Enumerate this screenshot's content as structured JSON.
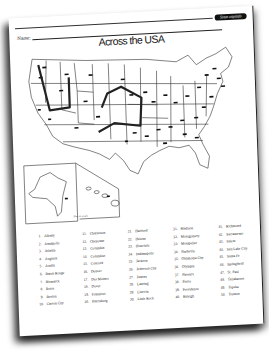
{
  "header": {
    "badge_label": "State capitals",
    "name_label": "Name"
  },
  "title": "Across the USA",
  "map": {
    "scale_note": "Not to scale",
    "route_color": "#222222",
    "insets": [
      "Alaska",
      "Hawaii"
    ]
  },
  "capitals": {
    "columns": [
      [
        {
          "num": "1.",
          "name": "Albany"
        },
        {
          "num": "2.",
          "name": "Annapolis"
        },
        {
          "num": "3.",
          "name": "Atlanta"
        },
        {
          "num": "4.",
          "name": "Augusta"
        },
        {
          "num": "5.",
          "name": "Austin"
        },
        {
          "num": "6.",
          "name": "Baton Rouge"
        },
        {
          "num": "7.",
          "name": "Bismarck"
        },
        {
          "num": "8.",
          "name": "Boise"
        },
        {
          "num": "9.",
          "name": "Boston"
        },
        {
          "num": "10.",
          "name": "Carson City"
        }
      ],
      [
        {
          "num": "11.",
          "name": "Charleston"
        },
        {
          "num": "12.",
          "name": "Cheyenne"
        },
        {
          "num": "13.",
          "name": "Columbia"
        },
        {
          "num": "14.",
          "name": "Columbus"
        },
        {
          "num": "15.",
          "name": "Concord"
        },
        {
          "num": "16.",
          "name": "Denver"
        },
        {
          "num": "17.",
          "name": "Des Moines"
        },
        {
          "num": "18.",
          "name": "Dover"
        },
        {
          "num": "19.",
          "name": "Frankfort"
        },
        {
          "num": "20.",
          "name": "Harrisburg"
        }
      ],
      [
        {
          "num": "21.",
          "name": "Hartford"
        },
        {
          "num": "22.",
          "name": "Helena"
        },
        {
          "num": "23.",
          "name": "Honolulu"
        },
        {
          "num": "24.",
          "name": "Indianapolis"
        },
        {
          "num": "25.",
          "name": "Jackson"
        },
        {
          "num": "26.",
          "name": "Jefferson City"
        },
        {
          "num": "27.",
          "name": "Juneau"
        },
        {
          "num": "28.",
          "name": "Lansing"
        },
        {
          "num": "29.",
          "name": "Lincoln"
        },
        {
          "num": "30.",
          "name": "Little Rock"
        }
      ],
      [
        {
          "num": "31.",
          "name": "Madison"
        },
        {
          "num": "32.",
          "name": "Montgomery"
        },
        {
          "num": "33.",
          "name": "Montpelier"
        },
        {
          "num": "34.",
          "name": "Nashville"
        },
        {
          "num": "35.",
          "name": "Oklahoma City"
        },
        {
          "num": "36.",
          "name": "Olympia"
        },
        {
          "num": "37.",
          "name": "Phoenix"
        },
        {
          "num": "38.",
          "name": "Pierre"
        },
        {
          "num": "39.",
          "name": "Providence"
        },
        {
          "num": "40.",
          "name": "Raleigh"
        }
      ],
      [
        {
          "num": "41.",
          "name": "Richmond"
        },
        {
          "num": "42.",
          "name": "Sacramento"
        },
        {
          "num": "43.",
          "name": "Salem"
        },
        {
          "num": "44.",
          "name": "Salt Lake City"
        },
        {
          "num": "45.",
          "name": "Santa Fe"
        },
        {
          "num": "46.",
          "name": "Springfield"
        },
        {
          "num": "47.",
          "name": "St. Paul"
        },
        {
          "num": "48.",
          "name": "Tallahassee"
        },
        {
          "num": "49.",
          "name": "Topeka"
        },
        {
          "num": "50.",
          "name": "Trenton"
        }
      ]
    ]
  }
}
